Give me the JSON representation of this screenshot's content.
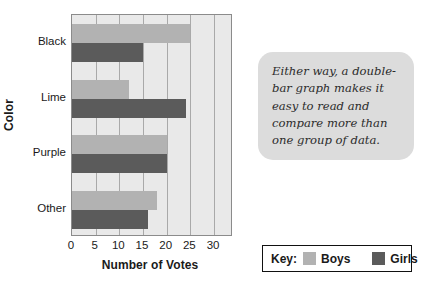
{
  "chart_data": {
    "type": "bar",
    "orientation": "horizontal",
    "title": "",
    "xlabel": "Number of Votes",
    "ylabel": "Color",
    "categories": [
      "Black",
      "Lime",
      "Purple",
      "Other"
    ],
    "series": [
      {
        "name": "Boys",
        "color": "#b2b2b2",
        "values": [
          25,
          12,
          20,
          18
        ]
      },
      {
        "name": "Girls",
        "color": "#5b5b5b",
        "values": [
          15,
          24,
          20,
          16
        ]
      }
    ],
    "xlim": [
      0,
      34
    ],
    "xticks": [
      0,
      5,
      10,
      15,
      20,
      25,
      30
    ],
    "xtick_labels": [
      "0",
      "5",
      "10",
      "15",
      "20",
      "25",
      "30"
    ],
    "grid": true,
    "grid_axis": "x",
    "plot_background": "#e9e9e9",
    "legend_position": "bottom-right"
  },
  "legend": {
    "title": "Key:",
    "entries": [
      {
        "label": "Boys",
        "color": "#b2b2b2"
      },
      {
        "label": "Girls",
        "color": "#5b5b5b"
      }
    ]
  },
  "callout": {
    "text": "Either way, a double-bar graph makes it easy to read and compare more than one group of data.",
    "background": "#dcdcdc"
  }
}
